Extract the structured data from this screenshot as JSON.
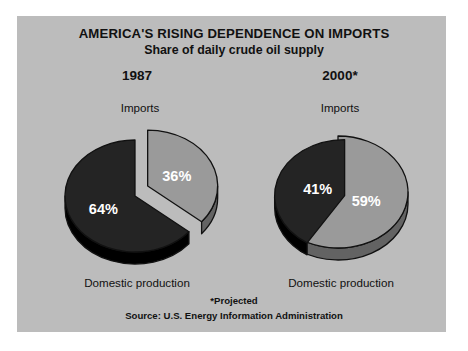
{
  "figure": {
    "background": "#ffffff",
    "panel_color": "#bcbcbc",
    "title": "AMERICA'S RISING DEPENDENCE ON IMPORTS",
    "subtitle": "Share of daily crude oil supply",
    "footnote": "*Projected",
    "source": "Source: U.S. Energy Information Administration"
  },
  "left_chart": {
    "year": "1987",
    "imports_label": "Imports",
    "domestic_label": "Domestic production",
    "imports_value": "36%",
    "domestic_value": "64%"
  },
  "right_chart": {
    "year": "2000*",
    "imports_label": "Imports",
    "domestic_label": "Domestic production",
    "imports_value": "59%",
    "domestic_value": "41%"
  },
  "colors": {
    "imports": "#9a9a9a",
    "domestic": "#242424",
    "edge": "#111111",
    "text": "#111111",
    "value_text": "#ffffff"
  },
  "chart_data": {
    "type": "pie",
    "title": "AMERICA'S RISING DEPENDENCE ON IMPORTS",
    "subtitle": "Share of daily crude oil supply",
    "unit": "percent",
    "legend_position": "none",
    "grid": false,
    "charts": [
      {
        "name": "1987",
        "label": "1987",
        "categories": [
          "Imports",
          "Domestic production"
        ],
        "values": [
          36,
          64
        ],
        "data_labels": [
          "36%",
          "64%"
        ],
        "colors": [
          "#9a9a9a",
          "#242424"
        ],
        "exploded": [
          "Imports"
        ]
      },
      {
        "name": "2000*",
        "label": "2000*",
        "categories": [
          "Imports",
          "Domestic production"
        ],
        "values": [
          59,
          41
        ],
        "data_labels": [
          "59%",
          "41%"
        ],
        "colors": [
          "#9a9a9a",
          "#242424"
        ],
        "exploded": [
          "Domestic production"
        ]
      }
    ],
    "annotations": [
      "*Projected",
      "Source: U.S. Energy Information Administration"
    ]
  }
}
